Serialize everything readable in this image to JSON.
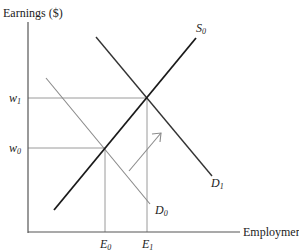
{
  "diagram": {
    "type": "supply-demand",
    "y_axis_label": "Earnings ($)",
    "x_axis_label": "Employment",
    "y_ticks": [
      {
        "name": "w",
        "sub": "1"
      },
      {
        "name": "w",
        "sub": "0"
      }
    ],
    "x_ticks": [
      {
        "name": "E",
        "sub": "0"
      },
      {
        "name": "E",
        "sub": "1"
      }
    ],
    "curves": {
      "supply": {
        "name": "S",
        "sub": "0"
      },
      "demand_initial": {
        "name": "D",
        "sub": "0"
      },
      "demand_shifted": {
        "name": "D",
        "sub": "1"
      }
    },
    "annotation": "arrow indicating demand shift from D0 to D1",
    "colors": {
      "axis": "#555555",
      "supply": "#1a1a1a",
      "demand_initial": "#8a8a8a",
      "demand_shifted": "#333333",
      "guide": "#9a9a9a"
    }
  }
}
